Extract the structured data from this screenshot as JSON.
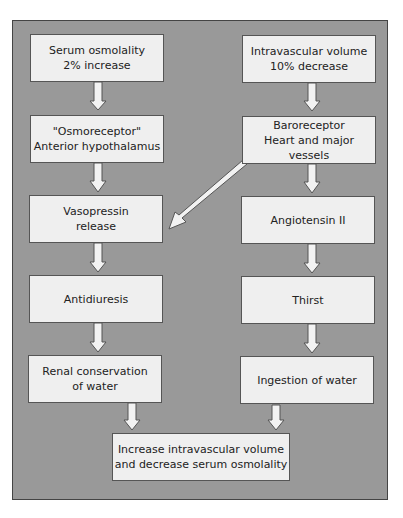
{
  "diagram": {
    "left_column": [
      {
        "id": "serum-osmolality",
        "label": "Serum osmolality\n2% increase"
      },
      {
        "id": "osmoreceptor",
        "label": "\"Osmoreceptor\"\nAnterior hypothalamus"
      },
      {
        "id": "vasopressin",
        "label": "Vasopressin\nrelease"
      },
      {
        "id": "antidiuresis",
        "label": "Antidiuresis"
      },
      {
        "id": "renal-conservation",
        "label": "Renal conservation\nof water"
      }
    ],
    "right_column": [
      {
        "id": "intravascular-volume",
        "label": "Intravascular volume\n10% decrease"
      },
      {
        "id": "baroreceptor",
        "label": "Baroreceptor\nHeart and major vessels"
      },
      {
        "id": "angiotensin",
        "label": "Angiotensin II"
      },
      {
        "id": "thirst",
        "label": "Thirst"
      },
      {
        "id": "ingestion",
        "label": "Ingestion of water"
      }
    ],
    "outcome": {
      "id": "outcome",
      "label": "Increase intravascular volume\nand decrease serum osmolality"
    },
    "edges": [
      [
        "serum-osmolality",
        "osmoreceptor"
      ],
      [
        "osmoreceptor",
        "vasopressin"
      ],
      [
        "vasopressin",
        "antidiuresis"
      ],
      [
        "antidiuresis",
        "renal-conservation"
      ],
      [
        "renal-conservation",
        "outcome"
      ],
      [
        "intravascular-volume",
        "baroreceptor"
      ],
      [
        "baroreceptor",
        "angiotensin"
      ],
      [
        "baroreceptor",
        "vasopressin"
      ],
      [
        "angiotensin",
        "thirst"
      ],
      [
        "thirst",
        "ingestion"
      ],
      [
        "ingestion",
        "outcome"
      ]
    ],
    "colors": {
      "panel": "#999999",
      "box": "#efefef",
      "border": "#555555",
      "arrow_fill": "#f2f2f2"
    }
  }
}
